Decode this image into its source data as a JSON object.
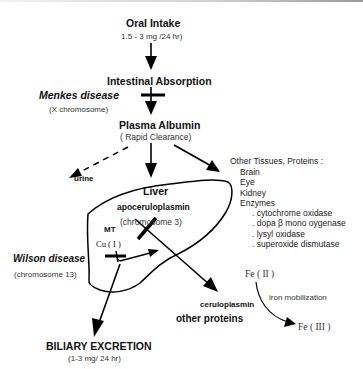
{
  "diagram": {
    "nodes": {
      "oral_intake": {
        "label": "Oral Intake",
        "sub": "1.5 - 3  mg /24 hr)"
      },
      "intestinal_absorption": {
        "label": "Intestinal Absorption"
      },
      "menkes": {
        "label": "Menkes disease",
        "sub": "(X chromosome)"
      },
      "plasma_albumin": {
        "label": "Plasma Albumin",
        "sub": "( Rapid  Clearance)"
      },
      "urine": {
        "label": "urine"
      },
      "other_tissues": {
        "label": "Other Tissues, Proteins :",
        "items": [
          "Brain",
          "Eye",
          "Kidney",
          "Enzymes"
        ],
        "enzymes": [
          ". cytochrome oxidase",
          ". dopa β mono oygenase",
          ". lysyl oxidase",
          ". superoxide dismutase"
        ]
      },
      "liver": {
        "label": "Liver",
        "apo": "apoceruloplasmin",
        "apo_sub": "(chromosome 3)",
        "mt": "MT",
        "cu": "Cu ( I )"
      },
      "wilson": {
        "label": "Wilson disease",
        "sub": "(chromosome 13)"
      },
      "ceruloplasmin": {
        "label": "ceruloplasmin"
      },
      "other_proteins": {
        "label": "other proteins"
      },
      "fe2": {
        "label": "Fe ( II )"
      },
      "iron_mob": {
        "label": "iron mobilization"
      },
      "fe3": {
        "label": "Fe ( III )"
      },
      "biliary": {
        "label": "BILIARY EXCRETION",
        "sub": "(1-3 mg/ 24 hr)"
      }
    },
    "edges": [
      {
        "from": "oral_intake",
        "to": "intestinal_absorption",
        "style": "solid"
      },
      {
        "from": "intestinal_absorption",
        "to": "plasma_albumin",
        "style": "solid",
        "blocked_by": "menkes"
      },
      {
        "from": "plasma_albumin",
        "to": "urine",
        "style": "dashed"
      },
      {
        "from": "plasma_albumin",
        "to": "liver",
        "style": "solid"
      },
      {
        "from": "plasma_albumin",
        "to": "other_tissues",
        "style": "solid"
      },
      {
        "from": "liver",
        "to": "ceruloplasmin",
        "style": "solid",
        "blocked_by": "wilson"
      },
      {
        "from": "liver",
        "to": "biliary",
        "style": "solid",
        "blocked_by": "wilson"
      },
      {
        "from": "fe2",
        "to": "fe3",
        "style": "curved",
        "label": "iron mobilization"
      }
    ]
  }
}
